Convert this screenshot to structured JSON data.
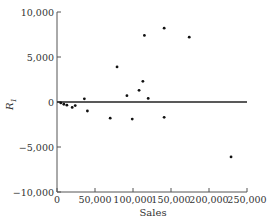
{
  "chart_data": {
    "type": "scatter",
    "title": "",
    "xlabel": "Sales",
    "ylabel": "R1",
    "ylabel_main": "R",
    "ylabel_sub": "1",
    "xlim": [
      0,
      250000
    ],
    "ylim": [
      -10000,
      10000
    ],
    "grid": false,
    "legend": null,
    "reference_line": {
      "y": 0
    },
    "x_ticks": [
      0,
      50000,
      100000,
      150000,
      200000,
      250000
    ],
    "x_tick_labels": [
      "0",
      "50,000",
      "100,000",
      "150,000",
      "200,000",
      "250,000"
    ],
    "y_ticks": [
      10000,
      5000,
      0,
      -5000,
      -10000
    ],
    "y_tick_labels": [
      "10,000",
      "5,000",
      "0",
      "−5,000",
      "−10,000"
    ],
    "series": [
      {
        "name": "Residuals",
        "points": [
          {
            "x": 5000,
            "y": -100
          },
          {
            "x": 9000,
            "y": -250
          },
          {
            "x": 13000,
            "y": -350
          },
          {
            "x": 20000,
            "y": -600
          },
          {
            "x": 24000,
            "y": -400
          },
          {
            "x": 36000,
            "y": 350
          },
          {
            "x": 40000,
            "y": -1000
          },
          {
            "x": 70000,
            "y": -1800
          },
          {
            "x": 79000,
            "y": 3900
          },
          {
            "x": 92000,
            "y": 700
          },
          {
            "x": 99000,
            "y": -1900
          },
          {
            "x": 108000,
            "y": 1300
          },
          {
            "x": 113000,
            "y": 2300
          },
          {
            "x": 115000,
            "y": 7400
          },
          {
            "x": 120000,
            "y": 400
          },
          {
            "x": 141000,
            "y": 8200
          },
          {
            "x": 141000,
            "y": -1700
          },
          {
            "x": 174000,
            "y": 7200
          },
          {
            "x": 229000,
            "y": -6100
          }
        ]
      }
    ]
  },
  "colors": {
    "axis": "#555555",
    "zero_line": "#222222",
    "point": "#111111",
    "text": "#333333"
  }
}
